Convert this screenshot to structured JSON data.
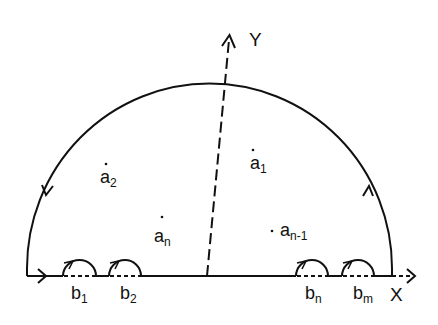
{
  "diagram": {
    "type": "contour-integration-semicircle",
    "axes": {
      "x_label": "X",
      "y_label": "Y"
    },
    "poles_inside": [
      {
        "name": "a",
        "sub": "1"
      },
      {
        "name": "a",
        "sub": "2"
      },
      {
        "name": "a",
        "sub": "n"
      },
      {
        "name": "a",
        "sub": "n-1"
      }
    ],
    "poles_on_axis": [
      {
        "name": "b",
        "sub": "1"
      },
      {
        "name": "b",
        "sub": "2"
      },
      {
        "name": "b",
        "sub": "n"
      },
      {
        "name": "b",
        "sub": "m"
      }
    ],
    "stroke_color": "#111111",
    "background": "#ffffff"
  }
}
